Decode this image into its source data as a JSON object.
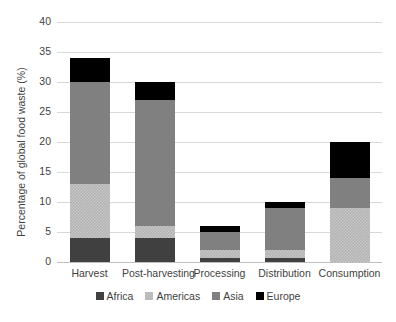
{
  "chart_data": {
    "type": "bar",
    "stacked": true,
    "title": "",
    "xlabel": "",
    "ylabel": "Percentage of global food waste (%)",
    "ylim": [
      0,
      40
    ],
    "yticks": [
      0,
      5,
      10,
      15,
      20,
      25,
      30,
      35,
      40
    ],
    "ytick_labels": [
      "0",
      "5",
      "10",
      "15",
      "20",
      "25",
      "30",
      "35",
      "40"
    ],
    "grid": true,
    "legend_position": "bottom",
    "categories": [
      "Harvest",
      "Post-harvesting",
      "Processing",
      "Distribution",
      "Consumption"
    ],
    "series": [
      {
        "name": "Africa",
        "color": "#404040",
        "values": [
          4,
          4,
          0.7,
          0.7,
          0
        ]
      },
      {
        "name": "Americas",
        "color": "#b3b3b3",
        "values": [
          9,
          2,
          1.3,
          1.3,
          9
        ]
      },
      {
        "name": "Asia",
        "color": "#808080",
        "values": [
          17,
          21,
          3,
          7,
          5
        ]
      },
      {
        "name": "Europe",
        "color": "#000000",
        "values": [
          4,
          3,
          1,
          1,
          6
        ]
      }
    ],
    "totals": [
      34,
      30,
      6,
      10,
      20
    ]
  },
  "legend": {
    "items": [
      {
        "label": "Africa"
      },
      {
        "label": "Americas"
      },
      {
        "label": "Asia"
      },
      {
        "label": "Europe"
      }
    ]
  }
}
